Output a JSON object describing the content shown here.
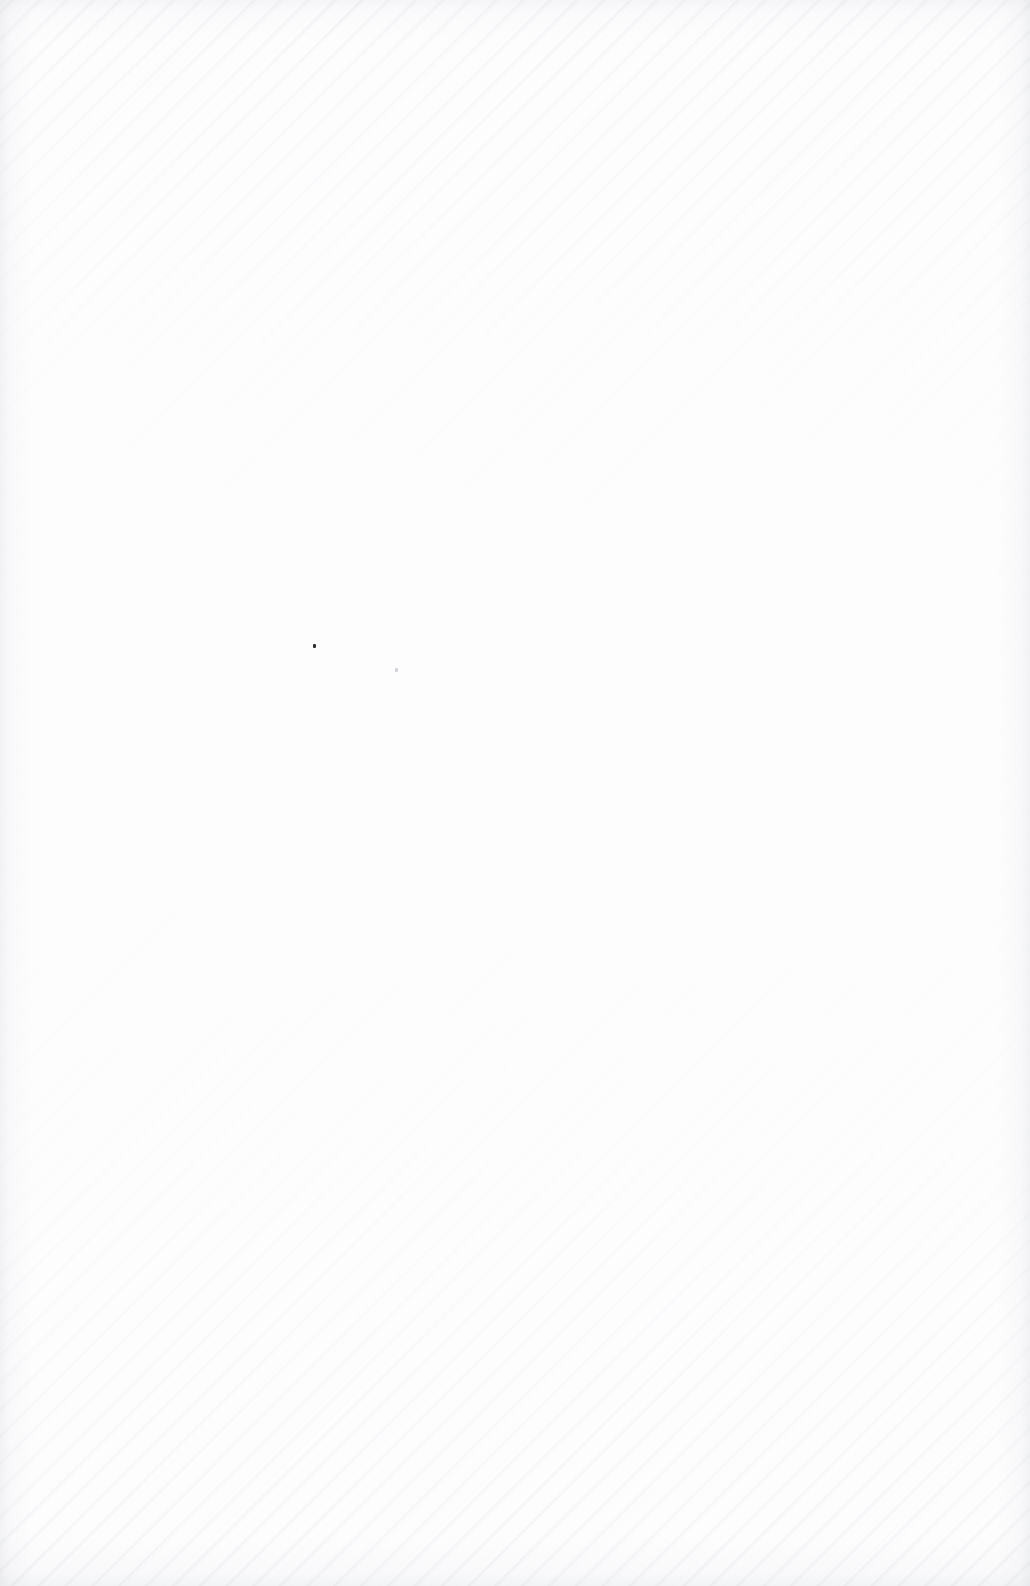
{
  "page": {
    "kind": "blank-scanned-page",
    "width_px": 1030,
    "height_px": 1586,
    "orientation": "portrait",
    "background_color": "#fdfdfe",
    "text_content": "",
    "has_visible_text": false
  },
  "surface": {
    "grain": {
      "name": "diagonal-paper-grain",
      "direction": "upper-left-to-lower-right",
      "angle_deg": 135,
      "period_px": 19,
      "color": "#8c919e",
      "strongest_regions": [
        "top-edge",
        "bottom-edge"
      ],
      "faintest_region": "center"
    },
    "vignette": {
      "name": "edge-vignette",
      "color": "#787e8c",
      "strongest_edges": [
        "left",
        "right",
        "bottom"
      ]
    }
  },
  "artifacts": [
    {
      "name": "dust-speck-primary",
      "x": 313,
      "y": 644,
      "width": 3,
      "height": 4,
      "color": "#1c1c22",
      "opacity": 0.92
    },
    {
      "name": "dust-speck-secondary",
      "x": 395,
      "y": 668,
      "width": 3,
      "height": 4,
      "color": "#9aa0ad",
      "opacity": 0.45
    }
  ]
}
